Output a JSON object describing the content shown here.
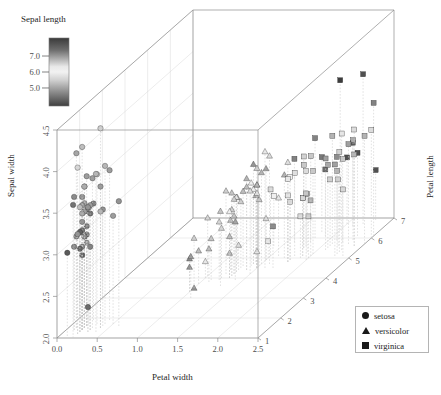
{
  "chart_data": {
    "type": "scatter",
    "title": "",
    "subtitle": "",
    "projection": "3d",
    "xlabel": "Petal width",
    "ylabel": "Sepal width",
    "zlabel": "Petal length",
    "colorbar_label": "Sepal length",
    "xticks": [
      "0.0",
      "0.5",
      "1.0",
      "1.5",
      "2.0",
      "2.5"
    ],
    "yticks": [
      "2.0",
      "2.5",
      "3.0",
      "3.5",
      "4.0",
      "4.5"
    ],
    "zticks": [
      "1",
      "2",
      "3",
      "4",
      "5",
      "6",
      "7"
    ],
    "colorbar_ticks": [
      "7.0",
      "6.0",
      "5.0"
    ],
    "xlim": [
      0.0,
      2.5
    ],
    "ylim": [
      2.0,
      4.5
    ],
    "zlim": [
      1,
      7
    ],
    "clim": [
      4.3,
      7.9
    ],
    "colormap": "grayscale-terrain",
    "grid": true,
    "droplines": true,
    "legend_position": "bottom-right",
    "legend": [
      {
        "label": "setosa",
        "marker": "circle"
      },
      {
        "label": "versicolor",
        "marker": "triangle"
      },
      {
        "label": "virginica",
        "marker": "square"
      }
    ],
    "series": [
      {
        "name": "setosa",
        "marker": "circle",
        "points": [
          [
            0.2,
            3.5,
            1.4,
            5.1
          ],
          [
            0.2,
            3.0,
            1.4,
            4.9
          ],
          [
            0.2,
            3.2,
            1.3,
            4.7
          ],
          [
            0.2,
            3.1,
            1.5,
            4.6
          ],
          [
            0.2,
            3.6,
            1.4,
            5.0
          ],
          [
            0.4,
            3.9,
            1.7,
            5.4
          ],
          [
            0.3,
            3.4,
            1.4,
            4.6
          ],
          [
            0.2,
            3.4,
            1.5,
            5.0
          ],
          [
            0.2,
            2.9,
            1.4,
            4.4
          ],
          [
            0.1,
            3.1,
            1.5,
            4.9
          ],
          [
            0.2,
            3.7,
            1.5,
            5.4
          ],
          [
            0.2,
            3.4,
            1.6,
            4.8
          ],
          [
            0.1,
            3.0,
            1.4,
            4.8
          ],
          [
            0.1,
            3.0,
            1.1,
            4.3
          ],
          [
            0.2,
            4.0,
            1.2,
            5.8
          ],
          [
            0.4,
            4.4,
            1.5,
            5.7
          ],
          [
            0.4,
            3.9,
            1.3,
            5.4
          ],
          [
            0.3,
            3.5,
            1.4,
            5.1
          ],
          [
            0.3,
            3.8,
            1.7,
            5.7
          ],
          [
            0.3,
            3.8,
            1.5,
            5.1
          ],
          [
            0.2,
            3.4,
            1.7,
            5.4
          ],
          [
            0.4,
            3.7,
            1.5,
            5.1
          ],
          [
            0.2,
            3.6,
            1.0,
            4.6
          ],
          [
            0.5,
            3.3,
            1.7,
            5.1
          ],
          [
            0.2,
            3.4,
            1.9,
            4.8
          ],
          [
            0.2,
            3.0,
            1.6,
            5.0
          ],
          [
            0.4,
            3.4,
            1.6,
            5.0
          ],
          [
            0.2,
            3.5,
            1.5,
            5.2
          ],
          [
            0.2,
            3.4,
            1.4,
            5.2
          ],
          [
            0.2,
            3.2,
            1.6,
            4.7
          ],
          [
            0.2,
            3.1,
            1.6,
            4.8
          ],
          [
            0.4,
            3.4,
            1.5,
            5.4
          ],
          [
            0.1,
            4.1,
            1.5,
            5.2
          ],
          [
            0.2,
            4.2,
            1.4,
            5.5
          ],
          [
            0.2,
            3.1,
            1.5,
            4.9
          ],
          [
            0.2,
            3.2,
            1.2,
            5.0
          ],
          [
            0.2,
            3.5,
            1.3,
            5.5
          ],
          [
            0.1,
            3.6,
            1.4,
            4.9
          ],
          [
            0.2,
            3.0,
            1.3,
            4.4
          ],
          [
            0.2,
            3.4,
            1.5,
            5.1
          ],
          [
            0.3,
            3.5,
            1.3,
            5.0
          ],
          [
            0.3,
            2.3,
            1.3,
            4.5
          ],
          [
            0.2,
            3.2,
            1.3,
            4.4
          ],
          [
            0.6,
            3.5,
            1.6,
            5.0
          ],
          [
            0.4,
            3.8,
            1.9,
            5.1
          ],
          [
            0.3,
            3.0,
            1.4,
            4.8
          ],
          [
            0.2,
            3.8,
            1.6,
            5.1
          ],
          [
            0.2,
            3.2,
            1.4,
            4.6
          ],
          [
            0.2,
            3.7,
            1.5,
            5.3
          ],
          [
            0.2,
            3.3,
            1.4,
            5.0
          ]
        ]
      },
      {
        "name": "versicolor",
        "marker": "triangle",
        "points": [
          [
            1.4,
            3.2,
            4.7,
            7.0
          ],
          [
            1.5,
            3.2,
            4.5,
            6.4
          ],
          [
            1.5,
            3.1,
            4.9,
            6.9
          ],
          [
            1.3,
            2.3,
            4.0,
            5.5
          ],
          [
            1.5,
            2.8,
            4.6,
            6.5
          ],
          [
            1.3,
            2.8,
            4.5,
            5.7
          ],
          [
            1.6,
            3.3,
            4.7,
            6.3
          ],
          [
            1.0,
            2.4,
            3.3,
            4.9
          ],
          [
            1.3,
            2.9,
            4.6,
            6.6
          ],
          [
            1.4,
            2.7,
            3.9,
            5.2
          ],
          [
            1.0,
            2.0,
            3.5,
            5.0
          ],
          [
            1.5,
            3.0,
            4.2,
            5.9
          ],
          [
            1.0,
            2.2,
            4.0,
            6.0
          ],
          [
            1.4,
            2.9,
            4.7,
            6.1
          ],
          [
            1.3,
            2.9,
            3.6,
            5.6
          ],
          [
            1.4,
            3.1,
            4.4,
            6.7
          ],
          [
            1.5,
            3.0,
            4.5,
            5.6
          ],
          [
            1.0,
            2.7,
            4.1,
            5.8
          ],
          [
            1.5,
            2.2,
            4.5,
            6.2
          ],
          [
            1.1,
            2.5,
            3.9,
            5.6
          ],
          [
            1.8,
            3.2,
            4.8,
            5.9
          ],
          [
            1.3,
            2.8,
            4.0,
            6.1
          ],
          [
            1.5,
            2.5,
            4.9,
            6.3
          ],
          [
            1.2,
            2.8,
            4.7,
            6.1
          ],
          [
            1.3,
            2.9,
            4.3,
            6.4
          ],
          [
            1.4,
            3.0,
            4.4,
            6.6
          ],
          [
            1.4,
            2.8,
            4.8,
            6.8
          ],
          [
            1.7,
            3.0,
            5.0,
            6.7
          ],
          [
            1.5,
            2.9,
            4.5,
            6.0
          ],
          [
            1.0,
            2.6,
            3.5,
            5.7
          ],
          [
            1.1,
            2.4,
            3.8,
            5.5
          ],
          [
            1.0,
            2.4,
            3.7,
            5.5
          ],
          [
            1.2,
            2.7,
            3.9,
            5.8
          ],
          [
            1.6,
            2.7,
            5.1,
            6.0
          ],
          [
            1.5,
            3.0,
            4.5,
            5.4
          ],
          [
            1.6,
            3.4,
            4.5,
            6.0
          ],
          [
            1.5,
            3.1,
            4.7,
            6.7
          ],
          [
            1.3,
            2.3,
            4.4,
            6.3
          ],
          [
            1.3,
            3.0,
            4.1,
            5.6
          ],
          [
            1.3,
            2.5,
            4.0,
            5.5
          ],
          [
            1.2,
            2.6,
            4.4,
            5.5
          ],
          [
            1.4,
            3.0,
            4.6,
            6.1
          ],
          [
            1.2,
            2.6,
            4.0,
            5.8
          ],
          [
            1.0,
            2.3,
            3.3,
            5.0
          ],
          [
            1.3,
            2.7,
            4.2,
            5.6
          ],
          [
            1.2,
            3.0,
            4.2,
            5.7
          ],
          [
            1.3,
            2.9,
            4.2,
            5.7
          ],
          [
            1.3,
            2.9,
            4.3,
            6.2
          ],
          [
            1.1,
            2.5,
            3.0,
            5.1
          ],
          [
            1.3,
            2.8,
            4.1,
            5.7
          ]
        ]
      },
      {
        "name": "virginica",
        "marker": "square",
        "points": [
          [
            2.5,
            3.3,
            6.0,
            6.3
          ],
          [
            1.9,
            2.7,
            5.1,
            5.8
          ],
          [
            2.1,
            3.0,
            5.9,
            7.1
          ],
          [
            1.8,
            2.9,
            5.6,
            6.3
          ],
          [
            2.2,
            3.0,
            5.8,
            6.5
          ],
          [
            2.1,
            3.0,
            6.6,
            7.6
          ],
          [
            1.7,
            2.5,
            4.5,
            4.9
          ],
          [
            1.8,
            2.9,
            6.3,
            7.3
          ],
          [
            1.8,
            2.5,
            5.8,
            6.7
          ],
          [
            2.5,
            3.6,
            6.1,
            7.2
          ],
          [
            2.0,
            3.2,
            5.1,
            6.5
          ],
          [
            1.9,
            2.7,
            5.3,
            6.4
          ],
          [
            2.1,
            3.0,
            5.5,
            6.8
          ],
          [
            2.0,
            2.5,
            5.0,
            5.7
          ],
          [
            2.4,
            2.8,
            5.1,
            5.8
          ],
          [
            2.3,
            3.2,
            5.3,
            6.4
          ],
          [
            1.8,
            3.0,
            5.5,
            6.5
          ],
          [
            2.2,
            3.8,
            6.7,
            7.7
          ],
          [
            2.3,
            2.6,
            6.9,
            7.7
          ],
          [
            1.5,
            2.2,
            5.0,
            6.0
          ],
          [
            2.3,
            3.2,
            5.7,
            6.9
          ],
          [
            2.0,
            2.8,
            4.9,
            5.6
          ],
          [
            2.0,
            2.8,
            6.7,
            7.7
          ],
          [
            1.8,
            2.7,
            4.9,
            6.3
          ],
          [
            2.1,
            3.3,
            5.7,
            6.7
          ],
          [
            1.8,
            3.2,
            6.0,
            7.2
          ],
          [
            1.8,
            2.8,
            4.8,
            6.2
          ],
          [
            1.8,
            3.0,
            4.9,
            6.1
          ],
          [
            2.1,
            2.8,
            5.6,
            6.4
          ],
          [
            1.6,
            3.0,
            5.8,
            7.2
          ],
          [
            1.9,
            2.8,
            6.1,
            7.4
          ],
          [
            2.0,
            3.8,
            6.4,
            7.9
          ],
          [
            2.2,
            2.8,
            5.6,
            6.4
          ],
          [
            1.5,
            2.8,
            5.1,
            6.3
          ],
          [
            1.4,
            2.6,
            5.6,
            6.1
          ],
          [
            2.3,
            3.0,
            6.1,
            7.7
          ],
          [
            2.4,
            3.4,
            5.6,
            6.3
          ],
          [
            1.8,
            3.1,
            5.5,
            6.4
          ],
          [
            1.8,
            3.0,
            4.8,
            6.0
          ],
          [
            2.1,
            3.1,
            5.4,
            6.9
          ],
          [
            2.4,
            3.1,
            5.6,
            6.7
          ],
          [
            2.3,
            3.1,
            5.1,
            6.9
          ],
          [
            1.9,
            2.7,
            5.1,
            5.8
          ],
          [
            2.3,
            3.2,
            5.9,
            6.8
          ],
          [
            2.5,
            3.3,
            5.7,
            6.7
          ],
          [
            2.3,
            3.0,
            5.2,
            6.7
          ],
          [
            1.9,
            2.5,
            5.0,
            6.3
          ],
          [
            2.0,
            3.0,
            5.2,
            6.5
          ],
          [
            2.3,
            3.4,
            5.4,
            6.2
          ],
          [
            1.8,
            3.0,
            5.1,
            5.9
          ]
        ]
      }
    ]
  },
  "axes": {
    "x_title": "Petal width",
    "y_title": "Sepal width",
    "z_title": "Petal length",
    "colorbar_title": "Sepal length"
  },
  "legend": {
    "setosa": "setosa",
    "versicolor": "versicolor",
    "virginica": "virginica"
  }
}
